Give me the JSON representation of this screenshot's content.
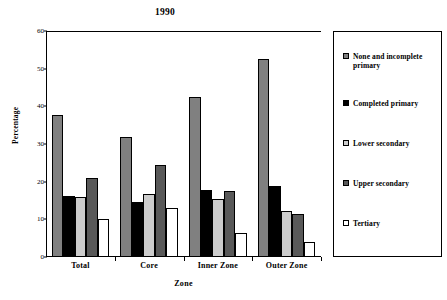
{
  "chart_data": {
    "type": "bar",
    "title": "1990",
    "xlabel": "Zone",
    "ylabel": "Percentage",
    "categories": [
      "Total",
      "Core",
      "Inner Zone",
      "Outer Zone"
    ],
    "series": [
      {
        "name": "None and incomplete primary",
        "color": "#808080",
        "values": [
          37.7,
          31.8,
          42.6,
          52.7
        ]
      },
      {
        "name": "Completed primary",
        "color": "#000000",
        "values": [
          16.2,
          14.5,
          17.7,
          18.9
        ]
      },
      {
        "name": "Lower secondary",
        "color": "#cccccc",
        "values": [
          16.0,
          16.8,
          15.4,
          12.3
        ]
      },
      {
        "name": "Upper secondary",
        "color": "#595959",
        "values": [
          21.0,
          24.4,
          17.6,
          11.4
        ]
      },
      {
        "name": "Tertiary",
        "color": "#ffffff",
        "values": [
          10.2,
          13.1,
          6.3,
          4.0
        ]
      }
    ],
    "ylim": [
      0,
      60
    ],
    "yticks": [
      0,
      10,
      20,
      30,
      40,
      50,
      60
    ],
    "ytick_labels": [
      "0",
      "10",
      "20",
      "30",
      "40",
      "50",
      "60"
    ],
    "grid": false,
    "legend_position": "right-outside"
  }
}
